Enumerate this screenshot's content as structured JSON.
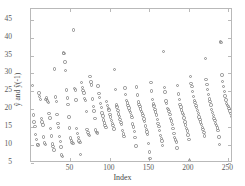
{
  "chart_data": {
    "type": "scatter",
    "title": "",
    "xlabel": "Index",
    "ylabel": "ŷ and ŷ(-1)",
    "xlim": [
      0,
      256
    ],
    "ylim": [
      5,
      48
    ],
    "grid": false,
    "legend": null,
    "marker": "open-circle",
    "marker_color": "#8d8d8d",
    "xticks": [
      50,
      100,
      150,
      200,
      250
    ],
    "yticks": [
      5,
      10,
      15,
      20,
      25,
      30,
      35,
      40,
      45
    ],
    "x": [
      2,
      3,
      4,
      5,
      6,
      7,
      8,
      9,
      10,
      11,
      12,
      13,
      14,
      15,
      16,
      17,
      18,
      19,
      20,
      21,
      22,
      23,
      24,
      25,
      26,
      27,
      28,
      29,
      30,
      31,
      32,
      33,
      34,
      35,
      36,
      37,
      38,
      39,
      40,
      41,
      42,
      43,
      44,
      45,
      46,
      47,
      48,
      49,
      50,
      51,
      52,
      53,
      54,
      55,
      56,
      57,
      58,
      59,
      60,
      61,
      62,
      63,
      64,
      65,
      66,
      67,
      68,
      69,
      70,
      71,
      72,
      73,
      74,
      75,
      76,
      77,
      78,
      79,
      80,
      81,
      82,
      83,
      84,
      85,
      86,
      87,
      88,
      89,
      90,
      91,
      92,
      93,
      94,
      95,
      96,
      97,
      98,
      99,
      100,
      101,
      102,
      103,
      104,
      105,
      106,
      107,
      108,
      109,
      110,
      111,
      112,
      113,
      114,
      115,
      116,
      117,
      118,
      119,
      120,
      121,
      122,
      123,
      124,
      125,
      126,
      127,
      128,
      129,
      130,
      131,
      132,
      133,
      134,
      135,
      136,
      137,
      138,
      139,
      140,
      141,
      142,
      143,
      144,
      145,
      146,
      147,
      148,
      149,
      150,
      151,
      152,
      153,
      154,
      155,
      156,
      157,
      158,
      159,
      160,
      161,
      162,
      163,
      164,
      165,
      166,
      167,
      168,
      169,
      170,
      171,
      172,
      173,
      174,
      175,
      176,
      177,
      178,
      179,
      180,
      181,
      182,
      183,
      184,
      185,
      186,
      187,
      188,
      189,
      190,
      191,
      192,
      193,
      194,
      195,
      196,
      197,
      198,
      199,
      200,
      201,
      202,
      203,
      204,
      205,
      206,
      207,
      208,
      209,
      210,
      211,
      212,
      213,
      214,
      215,
      216,
      217,
      218,
      219,
      220,
      221,
      222,
      223,
      224,
      225,
      226,
      227,
      228,
      229,
      230,
      231,
      232,
      233,
      234,
      235,
      236,
      237,
      238,
      239,
      240,
      241,
      242,
      243,
      244,
      245,
      246,
      247,
      248,
      249,
      250,
      251,
      252,
      253,
      254
    ],
    "y": [
      26.6,
      18.4,
      16.5,
      15.2,
      13.0,
      11.5,
      10.2,
      10.0,
      24.5,
      23.5,
      22.8,
      17.5,
      16.4,
      15.6,
      12.3,
      10.6,
      10.1,
      22.7,
      23.1,
      22.3,
      21.9,
      18.8,
      17.6,
      14.6,
      12.5,
      10.3,
      9.6,
      8.6,
      31.2,
      23.4,
      22.2,
      18.5,
      16.0,
      15.0,
      12.4,
      11.0,
      9.5,
      7.2,
      6.9,
      35.7,
      35.6,
      33.2,
      30.9,
      25.4,
      23.2,
      21.4,
      17.9,
      14.8,
      12.0,
      11.3,
      10.7,
      10.4,
      42.1,
      25.8,
      25.4,
      22.6,
      14.7,
      13.2,
      12.2,
      11.1,
      10.8,
      7.4,
      27.4,
      26.1,
      25.3,
      24.6,
      23.0,
      22.4,
      19.4,
      14.4,
      13.5,
      13.0,
      12.6,
      29.2,
      27.6,
      26.8,
      22.9,
      20.8,
      19.5,
      17.4,
      14.2,
      13.6,
      13.4,
      26.5,
      24.4,
      23.3,
      21.7,
      20.5,
      19.0,
      18.1,
      17.0,
      16.2,
      15.4,
      14.9,
      22.1,
      21.0,
      20.3,
      19.8,
      18.6,
      17.8,
      16.9,
      16.1,
      15.5,
      14.5,
      31.1,
      25.6,
      21.2,
      20.6,
      19.6,
      18.7,
      18.0,
      17.2,
      16.3,
      15.8,
      14.0,
      13.1,
      12.4,
      25.9,
      24.2,
      22.5,
      21.8,
      21.1,
      20.4,
      19.7,
      19.1,
      18.3,
      17.7,
      15.9,
      15.1,
      13.8,
      12.2,
      9.8,
      26.2,
      24.0,
      22.0,
      21.3,
      20.7,
      20.1,
      19.3,
      18.9,
      18.2,
      17.3,
      16.6,
      15.3,
      14.3,
      13.7,
      12.9,
      10.5,
      8.1,
      6.2,
      27.5,
      25.1,
      22.7,
      21.5,
      20.9,
      20.0,
      19.2,
      18.4,
      17.1,
      16.0,
      15.2,
      14.1,
      12.7,
      11.8,
      11.2,
      9.9,
      36.1,
      26.0,
      24.8,
      22.3,
      21.6,
      20.2,
      19.9,
      19.4,
      18.6,
      17.5,
      16.7,
      15.7,
      14.6,
      13.3,
      12.1,
      11.4,
      10.9,
      9.2,
      26.7,
      24.3,
      22.8,
      21.4,
      20.6,
      19.8,
      19.0,
      18.5,
      17.6,
      16.4,
      15.6,
      14.7,
      13.9,
      12.8,
      11.6,
      5.7,
      29.1,
      27.2,
      26.3,
      25.0,
      23.6,
      22.4,
      21.9,
      21.0,
      20.5,
      19.6,
      18.8,
      17.9,
      17.2,
      16.5,
      15.8,
      15.0,
      14.4,
      13.6,
      12.5,
      34.2,
      28.3,
      27.0,
      25.5,
      24.1,
      22.9,
      22.1,
      21.2,
      20.0,
      19.1,
      18.3,
      17.4,
      16.8,
      16.1,
      15.4,
      14.8,
      14.0,
      12.3,
      10.2,
      39.0,
      38.7,
      29.6,
      27.8,
      26.4,
      24.9,
      23.7,
      22.6,
      21.7,
      21.1,
      20.8,
      20.3,
      19.5,
      18.9,
      18.0,
      17.3,
      16.6,
      15.9,
      33.5,
      35.4,
      35.1,
      29.9,
      27.1,
      26.9,
      25.7,
      24.5,
      23.8,
      22.2,
      21.5,
      20.9,
      20.1,
      19.3,
      18.7,
      16.3,
      14.5,
      35.8,
      30.6,
      28.9,
      27.3,
      26.5,
      25.2,
      24.7,
      23.9,
      22.0
    ]
  },
  "axes": {
    "x_tick_labels": [
      "50",
      "100",
      "150",
      "200",
      "250"
    ],
    "y_tick_labels": [
      "5",
      "10",
      "15",
      "20",
      "25",
      "30",
      "35",
      "40",
      "45"
    ]
  }
}
